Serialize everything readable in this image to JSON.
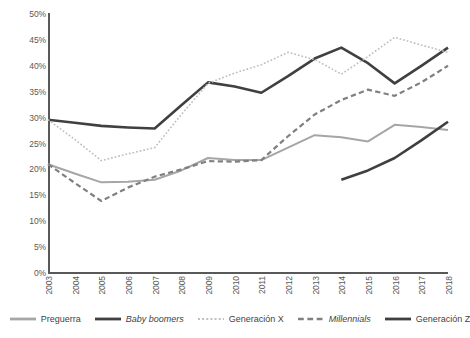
{
  "chart_data": {
    "type": "line",
    "title": "",
    "subtitle": "",
    "xlabel": "",
    "ylabel": "",
    "grid": false,
    "legend_position": "bottom",
    "x": [
      2003,
      2004,
      2005,
      2006,
      2007,
      2008,
      2009,
      2010,
      2011,
      2012,
      2013,
      2014,
      2015,
      2016,
      2017,
      2018
    ],
    "categories": [
      "2003",
      "2004",
      "2005",
      "2006",
      "2007",
      "2008",
      "2009",
      "2010",
      "2011",
      "2012",
      "2013",
      "2014",
      "2015",
      "2016",
      "2017",
      "2018"
    ],
    "ylim": [
      0,
      50
    ],
    "yticks": [
      0,
      5,
      10,
      15,
      20,
      25,
      30,
      35,
      40,
      45,
      50
    ],
    "ytick_labels": [
      "0%",
      "5%",
      "10%",
      "15%",
      "20%",
      "25%",
      "30%",
      "35%",
      "40%",
      "45%",
      "50%"
    ],
    "series": [
      {
        "name": "Preguerra",
        "color": "#a6a6a6",
        "style": "solid",
        "width": 2.0,
        "italic": false,
        "values": [
          21.0,
          19.2,
          17.5,
          17.6,
          18.0,
          19.8,
          22.2,
          21.8,
          21.8,
          24.2,
          26.6,
          26.2,
          25.4,
          28.6,
          28.2,
          27.6
        ]
      },
      {
        "name": "Baby boomers",
        "color": "#404040",
        "style": "solid",
        "width": 2.6,
        "italic": true,
        "values": [
          29.6,
          29.0,
          28.4,
          28.1,
          27.9,
          32.4,
          36.8,
          36.0,
          34.8,
          38.0,
          41.4,
          43.5,
          40.5,
          36.6,
          40.0,
          43.5
        ]
      },
      {
        "name": "Generación X",
        "color": "#bfbfbf",
        "style": "dotted",
        "width": 1.6,
        "italic": false,
        "values": [
          29.6,
          25.8,
          21.7,
          23.0,
          24.2,
          30.6,
          36.6,
          38.6,
          40.2,
          42.6,
          41.2,
          38.4,
          41.8,
          45.5,
          44.0,
          42.6
        ]
      },
      {
        "name": "Millennials",
        "color": "#808080",
        "style": "dashed",
        "width": 2.2,
        "italic": true,
        "values": [
          21.0,
          17.4,
          13.9,
          16.5,
          18.6,
          20.0,
          21.6,
          21.5,
          21.8,
          26.4,
          30.6,
          33.4,
          35.4,
          34.2,
          36.8,
          40.0
        ]
      },
      {
        "name": "Generación Z",
        "color": "#3f3f3f",
        "style": "solid",
        "width": 2.6,
        "italic": false,
        "values": [
          null,
          null,
          null,
          null,
          null,
          null,
          null,
          null,
          null,
          null,
          null,
          18.0,
          19.8,
          22.2,
          25.6,
          29.2
        ]
      }
    ]
  },
  "legend": {
    "items": [
      {
        "label": "Preguerra",
        "color": "#a6a6a6",
        "style": "solid",
        "italic": false,
        "icon": "line-swatch-solid"
      },
      {
        "label": "Baby boomers",
        "color": "#404040",
        "style": "solid",
        "italic": true,
        "icon": "line-swatch-solid"
      },
      {
        "label": "Generación X",
        "color": "#bfbfbf",
        "style": "dotted",
        "italic": false,
        "icon": "line-swatch-dotted"
      },
      {
        "label": "Millennials",
        "color": "#808080",
        "style": "dashed",
        "italic": true,
        "icon": "line-swatch-dashed"
      },
      {
        "label": "Generación Z",
        "color": "#3f3f3f",
        "style": "solid",
        "italic": false,
        "icon": "line-swatch-solid"
      }
    ]
  },
  "axes": {
    "y_tick_labels": [
      "50%",
      "45%",
      "40%",
      "35%",
      "30%",
      "25%",
      "20%",
      "15%",
      "10%",
      "5%",
      "0%"
    ],
    "x_tick_labels": [
      "2003",
      "2004",
      "2005",
      "2006",
      "2007",
      "2008",
      "2009",
      "2010",
      "2011",
      "2012",
      "2013",
      "2014",
      "2015",
      "2016",
      "2017",
      "2018"
    ]
  }
}
